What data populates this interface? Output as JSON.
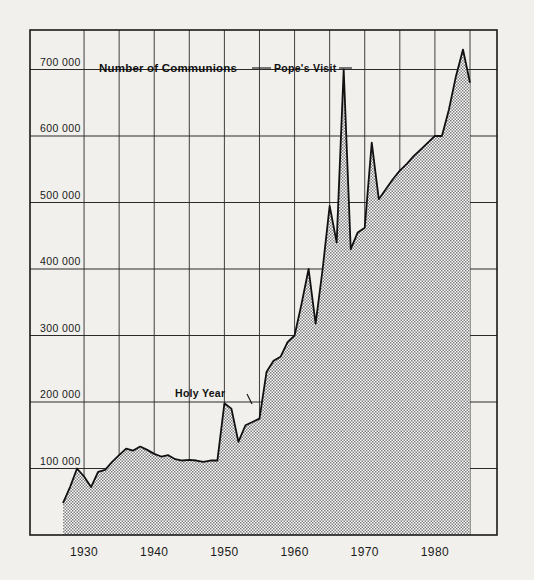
{
  "chart_data": {
    "type": "area",
    "title": "Number of Communions",
    "xlabel": "",
    "ylabel": "Number of Communions",
    "ylim": [
      0,
      740000
    ],
    "xlim": [
      1927,
      1985
    ],
    "grid": true,
    "legend": false,
    "y_ticks": [
      100000,
      200000,
      300000,
      400000,
      500000,
      600000,
      700000
    ],
    "y_tick_labels": [
      "100 000",
      "200 000",
      "300 000",
      "400 000",
      "500 000",
      "600 000",
      "700 000"
    ],
    "x_ticks": [
      1930,
      1940,
      1950,
      1960,
      1970,
      1980
    ],
    "x_tick_labels": [
      "1930",
      "1940",
      "1950",
      "1960",
      "1970",
      "1980"
    ],
    "x_minor_ticks": [
      1930,
      1935,
      1940,
      1945,
      1950,
      1955,
      1960,
      1965,
      1970,
      1975,
      1980,
      1985
    ],
    "annotations": [
      {
        "label": "Holy Year",
        "x": 1950,
        "y": 200000
      },
      {
        "label": "Pope's Visit",
        "x": 1967,
        "y": 700000
      }
    ],
    "x": [
      1927,
      1928,
      1929,
      1930,
      1931,
      1932,
      1933,
      1934,
      1935,
      1936,
      1937,
      1938,
      1939,
      1940,
      1941,
      1942,
      1943,
      1944,
      1945,
      1946,
      1947,
      1948,
      1949,
      1950,
      1951,
      1952,
      1953,
      1954,
      1955,
      1956,
      1957,
      1958,
      1959,
      1960,
      1961,
      1962,
      1963,
      1964,
      1965,
      1966,
      1967,
      1968,
      1969,
      1970,
      1971,
      1972,
      1973,
      1974,
      1975,
      1976,
      1977,
      1978,
      1979,
      1980,
      1981,
      1982,
      1983,
      1984,
      1985
    ],
    "values": [
      48000,
      72000,
      100000,
      88000,
      72000,
      95000,
      98000,
      110000,
      120000,
      130000,
      127000,
      133000,
      128000,
      122000,
      118000,
      120000,
      114000,
      112000,
      113000,
      112000,
      110000,
      112000,
      112000,
      198000,
      190000,
      140000,
      165000,
      170000,
      175000,
      245000,
      262000,
      268000,
      290000,
      300000,
      348000,
      400000,
      318000,
      400000,
      495000,
      440000,
      700000,
      430000,
      455000,
      462000,
      590000,
      505000,
      520000,
      535000,
      548000,
      558000,
      570000,
      580000,
      590000,
      600000,
      600000,
      640000,
      690000,
      730000,
      680000
    ],
    "series": [
      {
        "name": "Number of Communions",
        "values": [
          48000,
          72000,
          100000,
          88000,
          72000,
          95000,
          98000,
          110000,
          120000,
          130000,
          127000,
          133000,
          128000,
          122000,
          118000,
          120000,
          114000,
          112000,
          113000,
          112000,
          110000,
          112000,
          112000,
          198000,
          190000,
          140000,
          165000,
          170000,
          175000,
          245000,
          262000,
          268000,
          290000,
          300000,
          348000,
          400000,
          318000,
          400000,
          495000,
          440000,
          700000,
          430000,
          455000,
          462000,
          590000,
          505000,
          520000,
          535000,
          548000,
          558000,
          570000,
          580000,
          590000,
          600000,
          600000,
          640000,
          690000,
          730000,
          680000
        ]
      }
    ],
    "fill_color": "#a8a8a8",
    "line_color": "#111111",
    "background_color": "#f2f0ec"
  }
}
